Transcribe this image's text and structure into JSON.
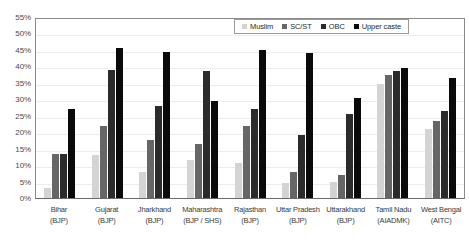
{
  "chart_data": {
    "type": "bar",
    "title": "",
    "xlabel": "",
    "ylabel": "",
    "ylim": [
      0,
      55
    ],
    "ytick_step": 5,
    "grid": true,
    "legend_position": "top-right",
    "categories": [
      "Bihar (BJP)",
      "Gujarat (BJP)",
      "Jharkhand (BJP)",
      "Maharashtra (BJP / SHS)",
      "Rajasthan (BJP)",
      "Uttar Pradesh (BJP)",
      "Uttarakhand (BJP)",
      "Tamil Nadu (AIADMK)",
      "West Bengal (AITC)"
    ],
    "ytick_labels": [
      "0%",
      "5%",
      "10%",
      "15%",
      "20%",
      "25%",
      "30%",
      "35%",
      "40%",
      "45%",
      "50%",
      "55%"
    ],
    "series": [
      {
        "name": "Muslim",
        "color": "#d4d4d4",
        "values": [
          3.0,
          13.0,
          8.0,
          11.5,
          10.5,
          4.5,
          5.0,
          34.5,
          21.0
        ]
      },
      {
        "name": "SC/ST",
        "color": "#666666",
        "values": [
          13.5,
          22.0,
          17.5,
          16.5,
          22.0,
          8.0,
          7.0,
          37.5,
          23.5
        ]
      },
      {
        "name": "OBC",
        "color": "#2b2b2b",
        "values": [
          13.5,
          39.0,
          28.0,
          38.5,
          27.0,
          19.0,
          25.5,
          38.5,
          26.5
        ]
      },
      {
        "name": "Upper caste",
        "color": "#0a0a0a",
        "values": [
          27.0,
          45.5,
          44.5,
          29.5,
          45.0,
          44.0,
          30.5,
          39.5,
          36.5
        ]
      }
    ]
  },
  "x_groups": [
    {
      "state": "Bihar",
      "party": "(BJP)"
    },
    {
      "state": "Gujarat",
      "party": "(BJP)"
    },
    {
      "state": "Jharkhand",
      "party": "(BJP)"
    },
    {
      "state": "Maharashtra",
      "party": "(BJP / SHS)"
    },
    {
      "state": "Rajasthan",
      "party": "(BJP)"
    },
    {
      "state": "Uttar Pradesh",
      "party": "(BJP)"
    },
    {
      "state": "Uttarakhand",
      "party": "(BJP)"
    },
    {
      "state": "Tamil Nadu",
      "party": "(AIADMK)"
    },
    {
      "state": "West Bengal",
      "party": "(AITC)"
    }
  ]
}
